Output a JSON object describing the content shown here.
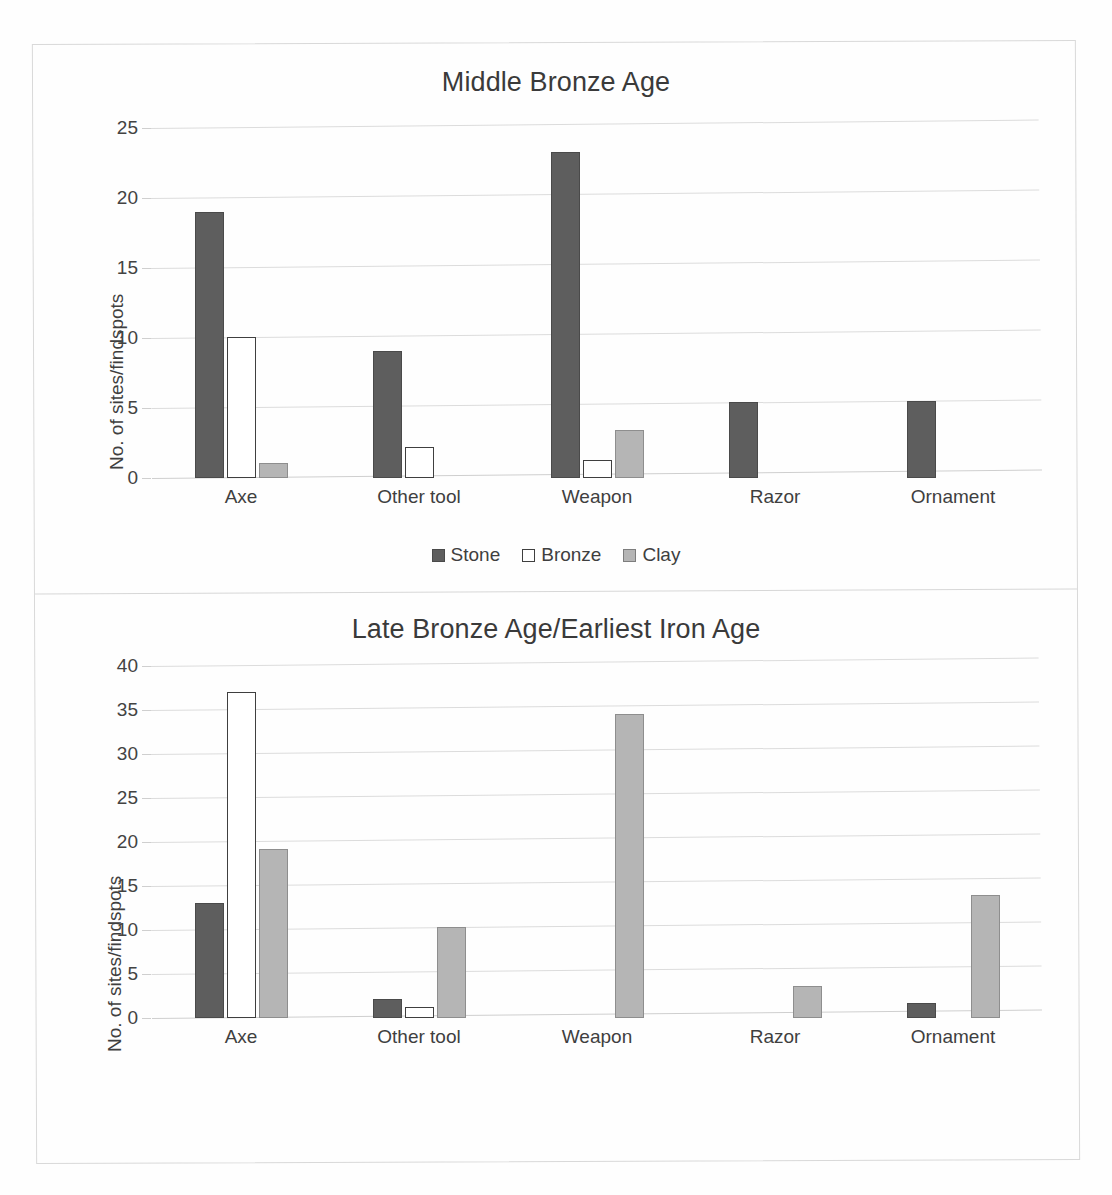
{
  "page": {
    "background_color": "#ffffff",
    "frame_color": "#d9d9d9"
  },
  "colors": {
    "stone": "#5e5e5e",
    "bronze": "#ffffff",
    "clay": "#b5b5b5",
    "gridline": "#dcdcdc",
    "text": "#3f3f3f"
  },
  "charts": [
    {
      "id": "chart-mba",
      "title": "Middle Bronze Age",
      "ylabel": "No. of sites/findspots",
      "yticks": [
        "0",
        "5",
        "10",
        "15",
        "20",
        "25"
      ],
      "legend": [
        {
          "label": "Stone",
          "key": "stone"
        },
        {
          "label": "Bronze",
          "key": "bronze"
        },
        {
          "label": "Clay",
          "key": "clay"
        }
      ],
      "categories": [
        "Axe",
        "Other tool",
        "Weapon",
        "Razor",
        "Ornament"
      ]
    },
    {
      "id": "chart-lba",
      "title": "Late Bronze Age/Earliest Iron Age",
      "ylabel": "No. of sites/findspots",
      "yticks": [
        "0",
        "5",
        "10",
        "15",
        "20",
        "25",
        "30",
        "35",
        "40"
      ],
      "legend": [
        {
          "label": "Stone",
          "key": "stone"
        },
        {
          "label": "Bronze",
          "key": "bronze"
        },
        {
          "label": "Clay",
          "key": "clay"
        }
      ],
      "categories": [
        "Axe",
        "Other tool",
        "Weapon",
        "Razor",
        "Ornament"
      ]
    }
  ],
  "chart_data": [
    {
      "type": "bar",
      "title": "Middle Bronze Age",
      "xlabel": "",
      "ylabel": "No. of sites/findspots",
      "ylim": [
        0,
        25
      ],
      "ytick_step": 5,
      "grid": true,
      "legend_position": "bottom",
      "categories": [
        "Axe",
        "Other tool",
        "Weapon",
        "Razor",
        "Ornament"
      ],
      "series": [
        {
          "name": "Stone",
          "color": "#5e5e5e",
          "values": [
            19.0,
            9.1,
            23.3,
            5.4,
            5.5
          ]
        },
        {
          "name": "Bronze",
          "color": "#ffffff",
          "values": [
            10.1,
            2.2,
            1.3,
            0,
            0
          ]
        },
        {
          "name": "Clay",
          "color": "#b5b5b5",
          "values": [
            1.1,
            0,
            3.4,
            0,
            0
          ]
        }
      ]
    },
    {
      "type": "bar",
      "title": "Late Bronze Age/Earliest Iron Age",
      "xlabel": "",
      "ylabel": "No. of sites/findspots",
      "ylim": [
        0,
        40
      ],
      "ytick_step": 5,
      "grid": true,
      "legend_position": "bottom",
      "categories": [
        "Axe",
        "Other tool",
        "Weapon",
        "Razor",
        "Ornament"
      ],
      "series": [
        {
          "name": "Stone",
          "color": "#5e5e5e",
          "values": [
            13.1,
            2.2,
            0,
            0,
            1.7
          ]
        },
        {
          "name": "Bronze",
          "color": "#ffffff",
          "values": [
            37.1,
            1.3,
            0,
            0,
            0
          ]
        },
        {
          "name": "Clay",
          "color": "#b5b5b5",
          "values": [
            19.2,
            10.3,
            34.5,
            3.6,
            14.0
          ]
        }
      ]
    }
  ]
}
